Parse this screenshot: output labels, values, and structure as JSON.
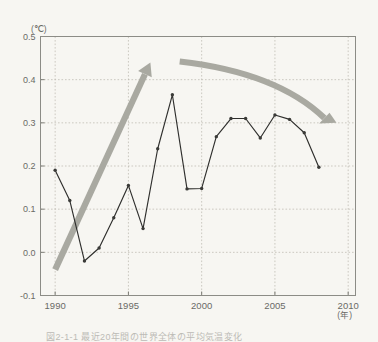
{
  "chart_data": {
    "type": "line",
    "title": "",
    "xlabel": "(年)",
    "ylabel": "(℃)",
    "xlim": [
      1989,
      2010.5
    ],
    "ylim": [
      -0.1,
      0.5
    ],
    "xticks": [
      1990,
      1995,
      2000,
      2005,
      2010
    ],
    "xtick_labels": [
      "1990",
      "1995",
      "2000",
      "2005",
      "2010"
    ],
    "yticks": [
      -0.1,
      0.0,
      0.1,
      0.2,
      0.3,
      0.4,
      0.5
    ],
    "ytick_labels": [
      "-0.1",
      "0.0",
      "0.1",
      "0.2",
      "0.3",
      "0.4",
      "0.5"
    ],
    "grid": true,
    "legend": "none",
    "x": [
      1990,
      1991,
      1992,
      1993,
      1994,
      1995,
      1996,
      1997,
      1998,
      1999,
      2000,
      2001,
      2002,
      2003,
      2004,
      2005,
      2006,
      2007,
      2008
    ],
    "values": [
      0.19,
      0.12,
      -0.02,
      0.01,
      0.08,
      0.155,
      0.055,
      0.24,
      0.365,
      0.147,
      0.148,
      0.268,
      0.31,
      0.31,
      0.265,
      0.318,
      0.308,
      0.277,
      0.197
    ],
    "series": [
      {
        "name": "anomaly",
        "values": [
          0.19,
          0.12,
          -0.02,
          0.01,
          0.08,
          0.155,
          0.055,
          0.24,
          0.365,
          0.147,
          0.148,
          0.268,
          0.31,
          0.31,
          0.265,
          0.318,
          0.308,
          0.277,
          0.197
        ]
      }
    ],
    "annotations": [
      {
        "name": "rising-trend-arrow",
        "direction": "up",
        "x_start": 1990.0,
        "y_start": -0.04,
        "x_end": 1996.5,
        "y_end": 0.44
      },
      {
        "name": "falling-trend-arrow",
        "direction": "down",
        "x_start": 1998.5,
        "y_start": 0.442,
        "x_end": 2009.2,
        "y_end": 0.3
      }
    ],
    "colors": {
      "series_line": "#2f2f2d",
      "marker": "#3a3a37",
      "arrow": "#a9a9a1",
      "gridline": "#b9b6ac",
      "frame": "#8c8c86",
      "tick_text": "#6a6a66",
      "background": "#f7f6f2"
    }
  },
  "axis": {
    "y_unit": "(℃)",
    "x_unit": "(年)"
  },
  "caption": {
    "text": "図2-1-1 最近20年間の世界全体の平均気温変化"
  }
}
